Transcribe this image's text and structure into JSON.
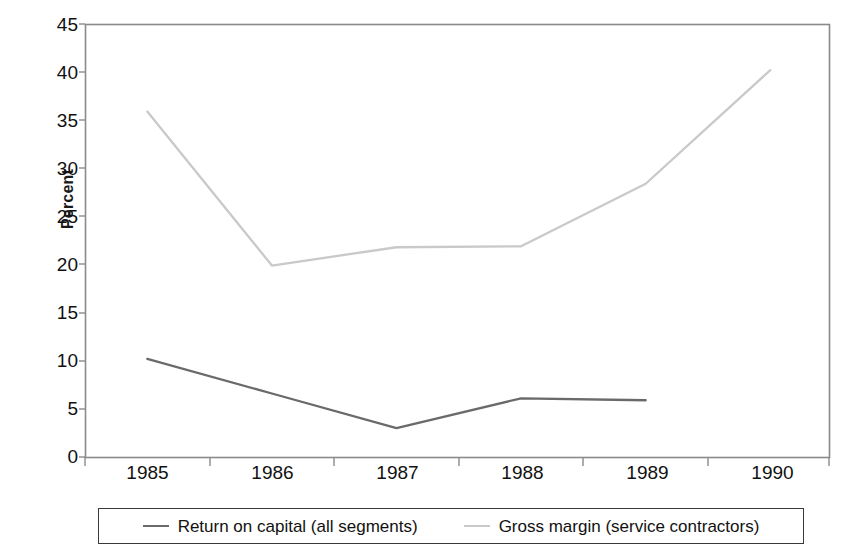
{
  "chart_data": {
    "type": "line",
    "title": "",
    "subtitle": "",
    "xlabel": "",
    "ylabel": "Percent",
    "categories": [
      "1985",
      "1986",
      "1987",
      "1988",
      "1989",
      "1990"
    ],
    "x": [
      1985,
      1986,
      1987,
      1988,
      1989,
      1990
    ],
    "series": [
      {
        "name": "Return on capital (all segments)",
        "color": "#6a6a6a",
        "values": [
          10.2,
          6.6,
          3.0,
          6.1,
          5.9,
          null
        ]
      },
      {
        "name": "Gross margin (service contractors)",
        "color": "#c9c9c9",
        "values": [
          35.9,
          19.9,
          21.8,
          21.9,
          28.4,
          40.2
        ]
      }
    ],
    "ylim": [
      0,
      45
    ],
    "ytick_step": 5,
    "yticks": [
      "45",
      "40",
      "35",
      "30",
      "25",
      "20",
      "15",
      "10",
      "5",
      "0"
    ],
    "grid": false,
    "legend_position": "bottom"
  },
  "axes": {
    "y_title": "Percent",
    "y_tick_labels": [
      "45",
      "40",
      "35",
      "30",
      "25",
      "20",
      "15",
      "10",
      "5",
      "0"
    ],
    "x_tick_labels": [
      "1985",
      "1986",
      "1987",
      "1988",
      "1989",
      "1990"
    ]
  },
  "legend": {
    "items": [
      {
        "label": "Return on capital (all segments)",
        "color": "#6a6a6a"
      },
      {
        "label": "Gross margin (service contractors)",
        "color": "#c9c9c9"
      }
    ]
  },
  "style": {
    "plot_border_color": "#8a8a8a",
    "background": "#ffffff",
    "series_dark": "#6a6a6a",
    "series_light": "#c9c9c9"
  }
}
